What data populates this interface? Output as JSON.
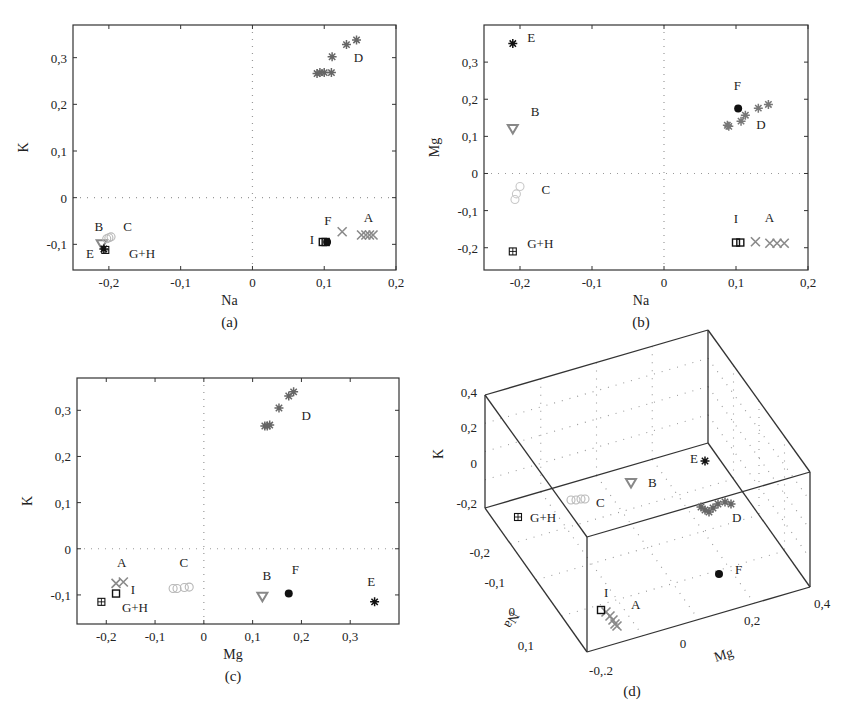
{
  "chart_data": [
    {
      "id": "a",
      "type": "scatter",
      "caption": "(a)",
      "xlabel": "Na",
      "ylabel": "K",
      "xlim": [
        -0.25,
        0.2
      ],
      "ylim": [
        -0.155,
        0.37
      ],
      "xticks": [
        -0.2,
        -0.1,
        0,
        0.1,
        0.2
      ],
      "xticklabels": [
        "-0,2",
        "-0,1",
        "0",
        "0,1",
        "0,2"
      ],
      "yticks": [
        -0.1,
        0,
        0.1,
        0.2,
        0.3
      ],
      "yticklabels": [
        "-0,1",
        "0",
        "0,1",
        "0,2",
        "0,3"
      ],
      "zero_lines": true,
      "box": {
        "left": 73,
        "top": 25,
        "right": 396,
        "bottom": 270
      },
      "series": [
        {
          "name": "A",
          "marker": "x",
          "color": "#8a8a8a",
          "points": [
            [
              0.125,
              -0.073
            ],
            [
              0.152,
              -0.08
            ],
            [
              0.158,
              -0.08
            ],
            [
              0.163,
              -0.08
            ],
            [
              0.168,
              -0.08
            ]
          ]
        },
        {
          "name": "B",
          "marker": "triangle-down",
          "color": "#888888",
          "points": [
            [
              -0.21,
              -0.1
            ]
          ]
        },
        {
          "name": "C",
          "marker": "circle-open",
          "color": "#b8b8b8",
          "points": [
            [
              -0.203,
              -0.088
            ],
            [
              -0.2,
              -0.086
            ],
            [
              -0.197,
              -0.084
            ]
          ]
        },
        {
          "name": "D",
          "marker": "star",
          "color": "#666666",
          "points": [
            [
              0.145,
              0.338
            ],
            [
              0.131,
              0.328
            ],
            [
              0.111,
              0.302
            ],
            [
              0.09,
              0.266
            ],
            [
              0.094,
              0.268
            ],
            [
              0.1,
              0.268
            ],
            [
              0.11,
              0.268
            ]
          ]
        },
        {
          "name": "E",
          "marker": "star",
          "color": "#111111",
          "points": [
            [
              -0.207,
              -0.11
            ]
          ]
        },
        {
          "name": "F",
          "marker": "dot",
          "color": "#111111",
          "points": [
            [
              0.104,
              -0.095
            ]
          ]
        },
        {
          "name": "G+H",
          "marker": "square-plus",
          "color": "#111111",
          "points": [
            [
              -0.205,
              -0.112
            ]
          ]
        },
        {
          "name": "I",
          "marker": "square",
          "color": "#111111",
          "points": [
            [
              0.098,
              -0.095
            ],
            [
              0.102,
              -0.095
            ]
          ]
        }
      ],
      "labels": [
        {
          "text": "A",
          "x": 0.155,
          "y": -0.053
        },
        {
          "text": "B",
          "x": -0.22,
          "y": -0.072
        },
        {
          "text": "C",
          "x": -0.18,
          "y": -0.072
        },
        {
          "text": "D",
          "x": 0.141,
          "y": 0.29
        },
        {
          "text": "E",
          "x": -0.232,
          "y": -0.13
        },
        {
          "text": "F",
          "x": 0.1,
          "y": -0.058
        },
        {
          "text": "G+H",
          "x": -0.172,
          "y": -0.13
        },
        {
          "text": "I",
          "x": 0.08,
          "y": -0.1
        }
      ]
    },
    {
      "id": "b",
      "type": "scatter",
      "caption": "(b)",
      "xlabel": "Na",
      "ylabel": "Mg",
      "xlim": [
        -0.25,
        0.2
      ],
      "ylim": [
        -0.26,
        0.4
      ],
      "xticks": [
        -0.2,
        -0.1,
        0,
        0.1,
        0.2
      ],
      "xticklabels": [
        "-0,2",
        "-0,1",
        "0",
        "0,1",
        "0,2"
      ],
      "yticks": [
        -0.2,
        -0.1,
        0,
        0.1,
        0.2,
        0.3
      ],
      "yticklabels": [
        "-0,2",
        "-0,1",
        "0",
        "0,1",
        "0,2",
        "0,3"
      ],
      "zero_lines": true,
      "box": {
        "left": 484,
        "top": 25,
        "right": 808,
        "bottom": 270
      },
      "series": [
        {
          "name": "A",
          "marker": "x",
          "color": "#8a8a8a",
          "points": [
            [
              0.127,
              -0.184
            ],
            [
              0.147,
              -0.188
            ],
            [
              0.157,
              -0.188
            ],
            [
              0.167,
              -0.188
            ]
          ]
        },
        {
          "name": "B",
          "marker": "triangle-down",
          "color": "#888888",
          "points": [
            [
              -0.21,
              0.12
            ]
          ]
        },
        {
          "name": "C",
          "marker": "circle-open",
          "color": "#c8c8c8",
          "points": [
            [
              -0.2,
              -0.035
            ],
            [
              -0.205,
              -0.055
            ],
            [
              -0.207,
              -0.07
            ]
          ]
        },
        {
          "name": "D",
          "marker": "star",
          "color": "#777777",
          "points": [
            [
              0.145,
              0.186
            ],
            [
              0.131,
              0.176
            ],
            [
              0.113,
              0.157
            ],
            [
              0.107,
              0.141
            ],
            [
              0.09,
              0.127
            ],
            [
              0.088,
              0.13
            ]
          ]
        },
        {
          "name": "E",
          "marker": "star",
          "color": "#111111",
          "points": [
            [
              -0.21,
              0.35
            ]
          ]
        },
        {
          "name": "F",
          "marker": "dot",
          "color": "#111111",
          "points": [
            [
              0.103,
              0.175
            ]
          ]
        },
        {
          "name": "G+H",
          "marker": "square-plus",
          "color": "#111111",
          "points": [
            [
              -0.21,
              -0.21
            ]
          ]
        },
        {
          "name": "I",
          "marker": "square",
          "color": "#111111",
          "points": [
            [
              0.1,
              -0.186
            ],
            [
              0.106,
              -0.186
            ]
          ]
        }
      ],
      "labels": [
        {
          "text": "A",
          "x": 0.14,
          "y": -0.13
        },
        {
          "text": "B",
          "x": -0.185,
          "y": 0.155
        },
        {
          "text": "C",
          "x": -0.17,
          "y": -0.055
        },
        {
          "text": "D",
          "x": 0.128,
          "y": 0.12
        },
        {
          "text": "E",
          "x": -0.19,
          "y": 0.353
        },
        {
          "text": "F",
          "x": 0.097,
          "y": 0.224
        },
        {
          "text": "G+H",
          "x": -0.19,
          "y": -0.2
        },
        {
          "text": "I",
          "x": 0.097,
          "y": -0.133
        }
      ]
    },
    {
      "id": "c",
      "type": "scatter",
      "caption": "(c)",
      "xlabel": "Mg",
      "ylabel": "K",
      "xlim": [
        -0.26,
        0.4
      ],
      "ylim": [
        -0.163,
        0.37
      ],
      "xticks": [
        -0.2,
        -0.1,
        0,
        0.1,
        0.2,
        0.3
      ],
      "xticklabels": [
        "-0,2",
        "-0,1",
        "0",
        "0,1",
        "0,2",
        "0,3"
      ],
      "yticks": [
        -0.1,
        0,
        0.1,
        0.2,
        0.3
      ],
      "yticklabels": [
        "-0,1",
        "0",
        "0,1",
        "0,2",
        "0,3"
      ],
      "zero_lines": true,
      "box": {
        "left": 77,
        "top": 378,
        "right": 399,
        "bottom": 624
      },
      "series": [
        {
          "name": "A",
          "marker": "x",
          "color": "#8a8a8a",
          "points": [
            [
              -0.165,
              -0.072
            ],
            [
              -0.18,
              -0.075
            ]
          ]
        },
        {
          "name": "B",
          "marker": "triangle-down",
          "color": "#888888",
          "points": [
            [
              0.12,
              -0.104
            ]
          ]
        },
        {
          "name": "C",
          "marker": "circle-open",
          "color": "#b8b8b8",
          "points": [
            [
              -0.063,
              -0.086
            ],
            [
              -0.055,
              -0.086
            ],
            [
              -0.04,
              -0.084
            ],
            [
              -0.03,
              -0.083
            ]
          ]
        },
        {
          "name": "D",
          "marker": "star",
          "color": "#666666",
          "points": [
            [
              0.184,
              0.34
            ],
            [
              0.174,
              0.331
            ],
            [
              0.154,
              0.305
            ],
            [
              0.125,
              0.266
            ],
            [
              0.13,
              0.266
            ],
            [
              0.135,
              0.268
            ]
          ]
        },
        {
          "name": "E",
          "marker": "star",
          "color": "#111111",
          "points": [
            [
              0.35,
              -0.115
            ]
          ]
        },
        {
          "name": "F",
          "marker": "dot",
          "color": "#111111",
          "points": [
            [
              0.174,
              -0.097
            ]
          ]
        },
        {
          "name": "G+H",
          "marker": "square-plus",
          "color": "#111111",
          "points": [
            [
              -0.21,
              -0.115
            ]
          ]
        },
        {
          "name": "I",
          "marker": "square",
          "color": "#111111",
          "points": [
            [
              -0.18,
              -0.097
            ]
          ]
        }
      ],
      "labels": [
        {
          "text": "A",
          "x": -0.178,
          "y": -0.04
        },
        {
          "text": "B",
          "x": 0.12,
          "y": -0.067
        },
        {
          "text": "C",
          "x": -0.05,
          "y": -0.04
        },
        {
          "text": "D",
          "x": 0.2,
          "y": 0.279
        },
        {
          "text": "E",
          "x": 0.335,
          "y": -0.08
        },
        {
          "text": "F",
          "x": 0.18,
          "y": -0.055
        },
        {
          "text": "G+H",
          "x": -0.168,
          "y": -0.137
        },
        {
          "text": "I",
          "x": -0.15,
          "y": -0.098
        }
      ]
    },
    {
      "id": "d",
      "type": "scatter3d",
      "caption": "(d)",
      "xlabel": "Mg",
      "ylabel": "Na",
      "zlabel": "K",
      "zticklabels": [
        "0,4",
        "0,2",
        "0",
        "-0,2"
      ],
      "yticklabels": [
        "-0,2",
        "-0,1",
        "0",
        "0,1"
      ],
      "xticklabels": [
        "-0,.2",
        "0",
        "0,2",
        "0,4"
      ],
      "box_vertices": {
        "top_back_left": [
          485,
          395
        ],
        "top_back_right": [
          708,
          330
        ],
        "top_right_far": [
          810,
          472
        ],
        "top_front": [
          587,
          537
        ],
        "bottom_left": [
          485,
          508
        ],
        "bottom_back_inner": [
          708,
          443
        ],
        "bottom_front": [
          587,
          652
        ],
        "bottom_right": [
          810,
          587
        ]
      },
      "projected_points": [
        {
          "name": "A",
          "marker": "x",
          "color": "#8a8a8a",
          "points": [
            [
              606,
              612
            ],
            [
              610,
              616
            ],
            [
              613,
              620
            ],
            [
              615,
              624
            ],
            [
              617,
              626
            ]
          ]
        },
        {
          "name": "B",
          "marker": "triangle-down",
          "color": "#888888",
          "points": [
            [
              631,
              483
            ]
          ]
        },
        {
          "name": "C",
          "marker": "circle-open",
          "color": "#b8b8b8",
          "points": [
            [
              571,
              500
            ],
            [
              576,
              500
            ],
            [
              581,
              499
            ],
            [
              585,
              499
            ]
          ]
        },
        {
          "name": "D",
          "marker": "star",
          "color": "#666666",
          "points": [
            [
              701,
              507
            ],
            [
              705,
              510
            ],
            [
              709,
              512
            ],
            [
              713,
              508
            ],
            [
              718,
              504
            ],
            [
              725,
              502
            ],
            [
              731,
              504
            ]
          ]
        },
        {
          "name": "E",
          "marker": "star",
          "color": "#111111",
          "points": [
            [
              705,
              461
            ]
          ]
        },
        {
          "name": "F",
          "marker": "dot",
          "color": "#111111",
          "points": [
            [
              719,
              574
            ]
          ]
        },
        {
          "name": "G+H",
          "marker": "square-plus",
          "color": "#111111",
          "points": [
            [
              518,
              517
            ]
          ]
        },
        {
          "name": "I",
          "marker": "square",
          "color": "#111111",
          "points": [
            [
              601,
              610
            ]
          ]
        }
      ],
      "labels": [
        {
          "text": "A",
          "x": 631,
          "y": 609
        },
        {
          "text": "B",
          "x": 648,
          "y": 487
        },
        {
          "text": "C",
          "x": 596,
          "y": 507
        },
        {
          "text": "D",
          "x": 732,
          "y": 522
        },
        {
          "text": "E",
          "x": 690,
          "y": 463
        },
        {
          "text": "F",
          "x": 735,
          "y": 574
        },
        {
          "text": "G+H",
          "x": 530,
          "y": 522
        },
        {
          "text": "I",
          "x": 604,
          "y": 597
        }
      ],
      "ztick_pos": [
        [
          477,
          397
        ],
        [
          477,
          432
        ],
        [
          477,
          468
        ],
        [
          477,
          508
        ]
      ],
      "ytick_pos": [
        [
          490,
          557
        ],
        [
          505,
          587
        ],
        [
          515,
          616
        ],
        [
          534,
          650
        ]
      ],
      "xtick_pos": [
        [
          601,
          675
        ],
        [
          683,
          648
        ],
        [
          752,
          625
        ],
        [
          822,
          608
        ]
      ]
    }
  ]
}
